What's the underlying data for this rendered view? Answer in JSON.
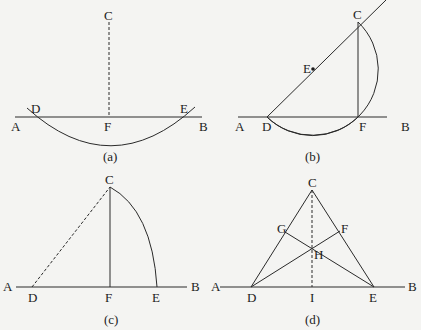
{
  "figure": {
    "panels": [
      {
        "id": "a",
        "caption": "(a)",
        "labels": {
          "A": "A",
          "B": "B",
          "C": "C",
          "D": "D",
          "E": "E",
          "F": "F"
        },
        "description": "Line AB with arc centered at C cutting AB at D and E; dashed perpendicular CF"
      },
      {
        "id": "b",
        "caption": "(b)",
        "labels": {
          "A": "A",
          "B": "B",
          "C": "C",
          "D": "D",
          "E": "E",
          "F": "F"
        },
        "description": "Circle on diameter DC with center E meeting AB at F; CF perpendicular to AB"
      },
      {
        "id": "c",
        "caption": "(c)",
        "labels": {
          "A": "A",
          "B": "B",
          "C": "C",
          "D": "D",
          "E": "E",
          "F": "F"
        },
        "description": "Arc from C to E, dashed DC, perpendicular CF"
      },
      {
        "id": "d",
        "caption": "(d)",
        "labels": {
          "A": "A",
          "B": "B",
          "C": "C",
          "D": "D",
          "E": "E",
          "F": "F",
          "G": "G",
          "H": "H",
          "I": "I"
        },
        "description": "Triangle CDE with altitudes DF and EG meeting at H; dashed CI perpendicular to AB"
      }
    ]
  }
}
